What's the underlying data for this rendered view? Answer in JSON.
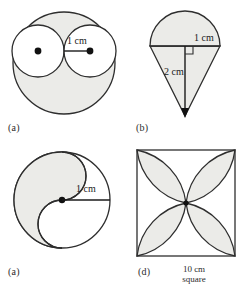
{
  "sheet": {
    "top_cut_text": "",
    "background_color": "#ffffff",
    "ink_color": "#2e2e2e",
    "shade_color": "#ebebe8"
  },
  "figures": [
    {
      "key": "a",
      "label": "(a)",
      "shape_name": "large-circle-with-two-inscribed-circles",
      "dimension_labels": [
        {
          "text": "1 cm",
          "measures": "radius-of-inner-circle"
        }
      ],
      "markers": [
        {
          "name": "left-inner-circle-center-dot"
        },
        {
          "name": "right-inner-circle-radius-endpoint-dot"
        }
      ]
    },
    {
      "key": "b",
      "label": "(b)",
      "shape_name": "semicircle-on-triangle-cone",
      "dimension_labels": [
        {
          "text": "1 cm",
          "measures": "semicircle-radius"
        },
        {
          "text": "2 cm",
          "measures": "triangle-height"
        }
      ],
      "markers": [
        {
          "name": "right-angle-mark"
        },
        {
          "name": "cone-apex-arrow"
        }
      ]
    },
    {
      "key": "c",
      "label": "(a)",
      "shape_name": "yin-yang-s-curve-circle",
      "dimension_labels": [
        {
          "text": "1 cm",
          "measures": "circle-radius"
        }
      ],
      "markers": [
        {
          "name": "circle-center-dot"
        }
      ]
    },
    {
      "key": "d",
      "label": "(d)",
      "shape_name": "square-with-four-petal-flower",
      "caption_lines": [
        "10 cm",
        "square"
      ],
      "dimension_labels": [],
      "markers": [
        {
          "name": "petal-center-point"
        }
      ]
    }
  ]
}
